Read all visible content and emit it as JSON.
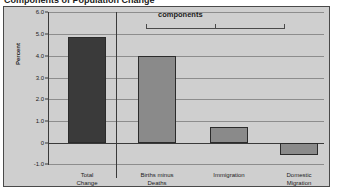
{
  "figure": {
    "cut_title": "Components of Population Change",
    "background_color": "#cfcfcf",
    "border_color": "#4a4a4a"
  },
  "annotation": {
    "bracket_label": "components"
  },
  "chart_data": {
    "type": "bar",
    "title": "",
    "xlabel": "",
    "ylabel": "Percent",
    "categories": [
      "Total Change",
      "Births minus Deaths",
      "Immigration",
      "Domestic Migration"
    ],
    "category_lines": [
      [
        "Total",
        "Change"
      ],
      [
        "Births minus",
        "Deaths"
      ],
      [
        "Immigration",
        ""
      ],
      [
        "Domestic",
        "Migration"
      ]
    ],
    "values": [
      4.85,
      4.0,
      0.75,
      -0.55
    ],
    "ylim": [
      -1.0,
      6.0
    ],
    "yticks": [
      6.0,
      5.0,
      4.0,
      3.0,
      2.0,
      1.0,
      0,
      -1.0
    ],
    "ytick_labels": [
      "6.0",
      "5.0",
      "4.0",
      "3.0",
      "2.0",
      "1.0",
      "0",
      "-1.0"
    ],
    "grid": true,
    "legend": "none",
    "bar_colors": [
      "#3a3a3a",
      "#8a8a8a",
      "#8a8a8a",
      "#8a8a8a"
    ],
    "annotations": [
      {
        "text": "components",
        "spans_categories": [
          "Births minus Deaths",
          "Immigration",
          "Domestic Migration"
        ]
      }
    ]
  }
}
